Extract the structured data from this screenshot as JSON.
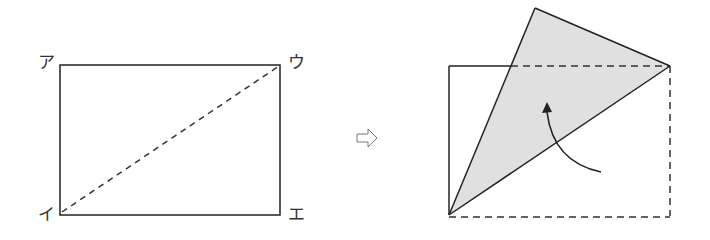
{
  "left_figure": {
    "labels": {
      "top_left": "ア",
      "bottom_left": "イ",
      "top_right": "ウ",
      "bottom_right": "エ"
    },
    "description": "Rectangle with dashed diagonal from イ to ウ"
  },
  "transition_arrow": "⇨",
  "right_figure": {
    "description": "Rectangle folded along diagonal イ–ウ; folded triangle shaded gray with curved arrow indicating fold direction"
  },
  "colors": {
    "line": "#222222",
    "shade": "#e0e0e0",
    "background": "#ffffff"
  }
}
